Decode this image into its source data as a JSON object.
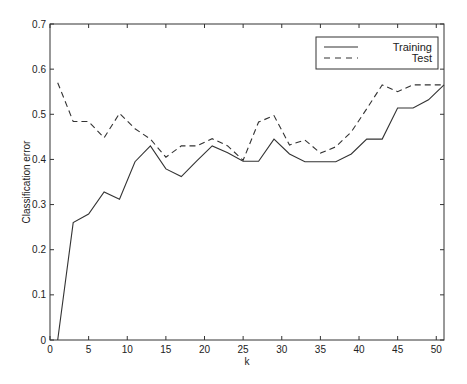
{
  "chart_data": {
    "type": "line",
    "title": "",
    "xlabel": "k",
    "ylabel": "Classification error",
    "xlim": [
      0,
      51
    ],
    "ylim": [
      0,
      0.7
    ],
    "xticks": [
      0,
      5,
      10,
      15,
      20,
      25,
      30,
      35,
      40,
      45,
      50
    ],
    "xtick_labels": [
      "0",
      "5",
      "10",
      "15",
      "20",
      "25",
      "30",
      "35",
      "40",
      "45",
      "50"
    ],
    "yticks": [
      0,
      0.1,
      0.2,
      0.3,
      0.4,
      0.5,
      0.6,
      0.7
    ],
    "ytick_labels": [
      "0",
      "0.1",
      "0.2",
      "0.3",
      "0.4",
      "0.5",
      "0.6",
      "0.7"
    ],
    "grid": false,
    "legend_position": "top-right",
    "x": [
      1,
      3,
      5,
      7,
      9,
      11,
      13,
      15,
      17,
      19,
      21,
      23,
      25,
      27,
      29,
      31,
      33,
      35,
      37,
      39,
      41,
      43,
      45,
      47,
      49,
      51
    ],
    "series": [
      {
        "name": "Training",
        "style": "solid",
        "values": [
          0.0,
          0.26,
          0.279,
          0.328,
          0.312,
          0.395,
          0.43,
          0.379,
          0.362,
          0.397,
          0.43,
          0.415,
          0.396,
          0.396,
          0.445,
          0.412,
          0.395,
          0.395,
          0.395,
          0.412,
          0.445,
          0.445,
          0.514,
          0.514,
          0.532,
          0.565
        ]
      },
      {
        "name": "Test",
        "style": "dashed",
        "values": [
          0.57,
          0.484,
          0.484,
          0.448,
          0.502,
          0.468,
          0.445,
          0.405,
          0.43,
          0.43,
          0.446,
          0.43,
          0.398,
          0.483,
          0.497,
          0.432,
          0.443,
          0.414,
          0.428,
          0.461,
          0.512,
          0.565,
          0.55,
          0.565,
          0.565,
          0.565
        ]
      }
    ]
  }
}
